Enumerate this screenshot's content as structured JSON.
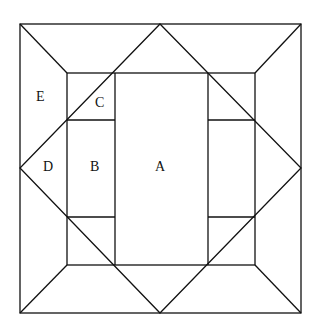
{
  "diagram": {
    "labels": [
      {
        "id": "A",
        "text": "A",
        "x": 160,
        "y": 168
      },
      {
        "id": "B",
        "text": "B",
        "x": 95,
        "y": 168
      },
      {
        "id": "C",
        "text": "C",
        "x": 101,
        "y": 104
      },
      {
        "id": "D",
        "text": "D",
        "x": 49,
        "y": 168
      },
      {
        "id": "E",
        "text": "E",
        "x": 41,
        "y": 98
      }
    ],
    "stroke_color": "#111111"
  }
}
